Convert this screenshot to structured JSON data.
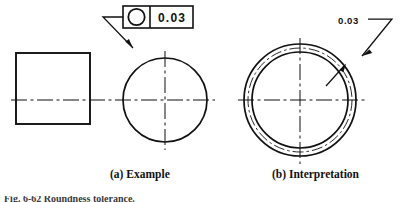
{
  "figure": {
    "captions": {
      "left": "(a) Example",
      "right": "(b) Interpretation"
    },
    "bottom_partial_text": "Fig. 6-62  Roundness tolerance."
  },
  "example_view": {
    "feature_control_frame": {
      "symbol_name": "circularity-symbol",
      "symbol_glyph": "○",
      "tolerance_value": "0.03",
      "leader_note": "leader from frame to circular feature outline"
    },
    "front_view_shape": "rectangle",
    "side_view_shape": "circle",
    "centerline_style": "dash-dot"
  },
  "interpretation_view": {
    "tolerance_label": "0.03",
    "zone_description": "annular tolerance zone between two concentric circles",
    "boundaries": [
      "outer-boundary-circle",
      "inner-boundary-circle"
    ],
    "actual_profile_style": "dash-dot",
    "arrow_count": 2
  },
  "colors": {
    "line": "#111111",
    "background": "#ffffff",
    "text": "#111111"
  }
}
